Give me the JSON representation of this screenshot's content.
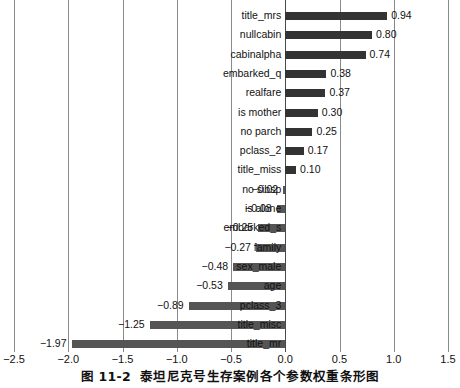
{
  "caption": {
    "number": "图 11-2",
    "text": "泰坦尼克号生存案例各个参数权重条形图"
  },
  "chart_data": {
    "type": "bar",
    "orientation": "horizontal",
    "title": "",
    "subtitle": "",
    "xlabel": "",
    "ylabel": "",
    "xlim": [
      -2.5,
      1.5
    ],
    "xticks": [
      "-2.5",
      "-2.0",
      "-1.5",
      "-1.0",
      "-0.5",
      "0.0",
      "0.5",
      "1.0",
      "1.5"
    ],
    "xtick_values": [
      -2.5,
      -2.0,
      -1.5,
      -1.0,
      -0.5,
      0.0,
      0.5,
      1.0,
      1.5
    ],
    "grid": true,
    "legend": "none",
    "bar_color": "#333333",
    "categories": [
      "title_mrs",
      "nullcabin",
      "cabinalpha",
      "embarked_q",
      "realfare",
      "is mother",
      "no parch",
      "pclass_2",
      "title_miss",
      "no sibsp",
      "is alone",
      "embarked_s",
      "family",
      "sex_male",
      "age",
      "pclass_3",
      "title_misc",
      "title_mr"
    ],
    "values": [
      0.94,
      0.8,
      0.74,
      0.38,
      0.37,
      0.3,
      0.25,
      0.17,
      0.1,
      -0.02,
      -0.08,
      -0.25,
      -0.27,
      -0.48,
      -0.53,
      -0.89,
      -1.25,
      -1.97
    ],
    "value_labels": [
      "0.94",
      "0.80",
      "0.74",
      "0.38",
      "0.37",
      "0.30",
      "0.25",
      "0.17",
      "0.10",
      "-0.02",
      "-0.08",
      "-0.25",
      "-0.27",
      "-0.48",
      "-0.53",
      "-0.89",
      "-1.25",
      "-1.97"
    ]
  }
}
